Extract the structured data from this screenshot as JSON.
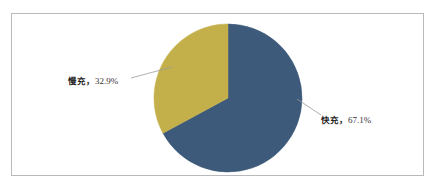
{
  "figure": {
    "background_color": "#ffffff",
    "frame_color": "#b9b9b9"
  },
  "chart_data": {
    "type": "pie",
    "title": "",
    "labels": [
      "快充",
      "慢充"
    ],
    "values": [
      67.1,
      32.9
    ],
    "value_suffix": "%",
    "colors": [
      "#3d5a7a",
      "#c4b04a"
    ],
    "start_angle_deg": 0,
    "direction": "clockwise",
    "legend": "none",
    "label_position": "outside-with-leader-lines",
    "slices": [
      {
        "name": "快充",
        "value": 67.1,
        "display": "快充，67.1%",
        "name_text": "快充，",
        "value_text": "67.1%",
        "color": "#3d5a7a",
        "start_deg": 0.0,
        "end_deg": 241.56
      },
      {
        "name": "慢充",
        "value": 32.9,
        "display": "慢充，32.9%",
        "name_text": "慢充，",
        "value_text": "32.9%",
        "color": "#c4b04a",
        "start_deg": 241.56,
        "end_deg": 360.0
      }
    ]
  },
  "geometry": {
    "center_x": 228,
    "center_y": 98,
    "radius": 74
  },
  "leader_lines": {
    "color": "#9a9a9a",
    "slow": {
      "x1": 172,
      "y1": 67,
      "x2": 131,
      "y2": 78
    },
    "fast": {
      "x1": 297,
      "y1": 99,
      "x2": 321,
      "y2": 115
    }
  }
}
